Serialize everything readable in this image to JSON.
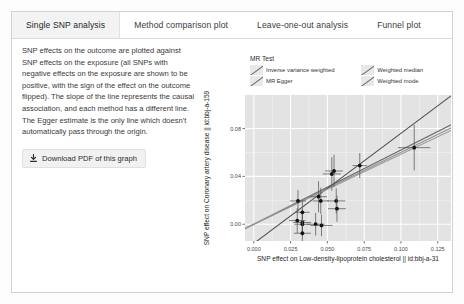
{
  "tabs": [
    {
      "label": "Single SNP analysis",
      "active": true
    },
    {
      "label": "Method comparison plot",
      "active": false
    },
    {
      "label": "Leave-one-out analysis",
      "active": false
    },
    {
      "label": "Funnel plot",
      "active": false
    }
  ],
  "panel": {
    "description": "SNP effects on the outcome are plotted against SNP effects on the exposure (all SNPs with negative effects on the exposure are shown to be positive, with the sign of the effect on the outcome flipped). The slope of the line represents the causal association, and each method has a different line. The Egger estimate is the only line which doesn't automatically pass through the origin.",
    "download_label": "Download PDF of this graph",
    "download_icon": "download-icon"
  },
  "chart_data": {
    "type": "scatter",
    "title": "",
    "legend_title": "MR Test",
    "legend_position": "top",
    "legend": [
      {
        "name": "Inverse variance weighted",
        "color": "#7a7a7a"
      },
      {
        "name": "Weighted median",
        "color": "#8a8a8a"
      },
      {
        "name": "MR Egger",
        "color": "#4a4a4a"
      },
      {
        "name": "Weighted mode",
        "color": "#9a9a9a"
      }
    ],
    "xlabel": "SNP effect on Low-density-lipoprotein cholesterol || id:bbj-a-31",
    "ylabel": "SNP effect on Coronary artery disease || id:bbj-a-159",
    "xticks": [
      "0.000",
      "0.025",
      "0.050",
      "0.075",
      "0.100",
      "0.125"
    ],
    "xtickvals": [
      0.0,
      0.025,
      0.05,
      0.075,
      0.1,
      0.125
    ],
    "yticks": [
      "0.00",
      "0.04",
      "0.08"
    ],
    "ytickvals": [
      0.0,
      0.04,
      0.08
    ],
    "xlim": [
      -0.006,
      0.134
    ],
    "ylim": [
      -0.014,
      0.108
    ],
    "grid": true,
    "panel_bg": "#e3e3e3",
    "grid_color": "#ffffff",
    "points": [
      {
        "x": 0.0295,
        "y": 0.003,
        "xerr": 0.0055,
        "yerr": 0.0105
      },
      {
        "x": 0.033,
        "y": 0.0015,
        "xerr": 0.006,
        "yerr": 0.011
      },
      {
        "x": 0.033,
        "y": 0.0,
        "xerr": 0.0055,
        "yerr": 0.01
      },
      {
        "x": 0.033,
        "y": -0.0075,
        "xerr": 0.0058,
        "yerr": 0.009
      },
      {
        "x": 0.033,
        "y": 0.01,
        "xerr": 0.005,
        "yerr": 0.0095
      },
      {
        "x": 0.03,
        "y": 0.0195,
        "xerr": 0.0055,
        "yerr": 0.009
      },
      {
        "x": 0.042,
        "y": 0.0,
        "xerr": 0.006,
        "yerr": 0.0095
      },
      {
        "x": 0.046,
        "y": -0.001,
        "xerr": 0.0075,
        "yerr": 0.009
      },
      {
        "x": 0.044,
        "y": 0.023,
        "xerr": 0.0058,
        "yerr": 0.013
      },
      {
        "x": 0.0455,
        "y": 0.0195,
        "xerr": 0.0055,
        "yerr": 0.011
      },
      {
        "x": 0.053,
        "y": 0.042,
        "xerr": 0.0062,
        "yerr": 0.014
      },
      {
        "x": 0.0545,
        "y": 0.0445,
        "xerr": 0.006,
        "yerr": 0.0135
      },
      {
        "x": 0.056,
        "y": 0.0195,
        "xerr": 0.0062,
        "yerr": 0.0105
      },
      {
        "x": 0.0565,
        "y": 0.013,
        "xerr": 0.006,
        "yerr": 0.011
      },
      {
        "x": 0.072,
        "y": 0.049,
        "xerr": 0.005,
        "yerr": 0.0105
      },
      {
        "x": 0.109,
        "y": 0.064,
        "xerr": 0.011,
        "yerr": 0.019
      }
    ],
    "lines": [
      {
        "name": "Inverse variance weighted",
        "intercept": 0.0,
        "slope": 0.62,
        "color": "#6f6f6f"
      },
      {
        "name": "Weighted median",
        "intercept": 0.0,
        "slope": 0.6,
        "color": "#8c8c8c"
      },
      {
        "name": "MR Egger",
        "intercept": -0.016,
        "slope": 0.92,
        "color": "#4f4f4f"
      },
      {
        "name": "Weighted mode",
        "intercept": 0.0,
        "slope": 0.585,
        "color": "#999999"
      }
    ]
  }
}
